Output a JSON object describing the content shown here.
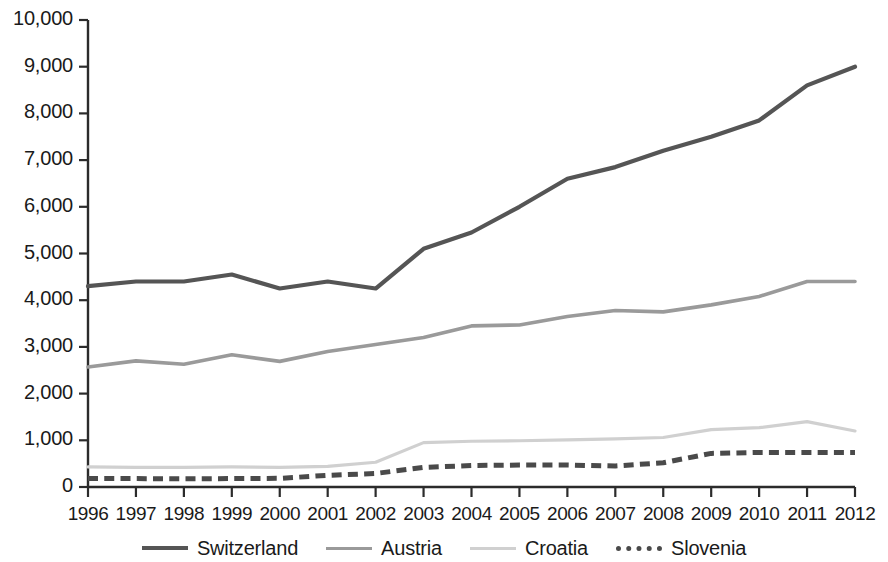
{
  "chart_data": {
    "type": "line",
    "title": "",
    "subtitle": "",
    "xlabel": "",
    "ylabel": "",
    "categories": [
      1996,
      1997,
      1998,
      1999,
      2000,
      2001,
      2002,
      2003,
      2004,
      2005,
      2006,
      2007,
      2008,
      2009,
      2010,
      2011,
      2012
    ],
    "x_tick_labels": [
      "1996",
      "1997",
      "1998",
      "1999",
      "2000",
      "2001",
      "2002",
      "2003",
      "2004",
      "2005",
      "2006",
      "2007",
      "2008",
      "2009",
      "2010",
      "2011",
      "2012"
    ],
    "y_tick_labels": [
      "0",
      "1,000",
      "2,000",
      "3,000",
      "4,000",
      "5,000",
      "6,000",
      "7,000",
      "8,000",
      "9,000",
      "10,000"
    ],
    "y_tick_values": [
      0,
      1000,
      2000,
      3000,
      4000,
      5000,
      6000,
      7000,
      8000,
      9000,
      10000
    ],
    "ylim": [
      0,
      10000
    ],
    "xlim": [
      1996,
      2012
    ],
    "grid": false,
    "legend_position": "bottom",
    "series": [
      {
        "name": "Switzerland",
        "color": "#555555",
        "style": "solid",
        "width": 4.2,
        "values": [
          4300,
          4400,
          4400,
          4550,
          4250,
          4400,
          4250,
          5100,
          5450,
          6000,
          6600,
          6850,
          7200,
          7500,
          7850,
          8600,
          9000
        ]
      },
      {
        "name": "Austria",
        "color": "#9a9a9a",
        "style": "solid",
        "width": 3.6,
        "values": [
          2570,
          2700,
          2630,
          2830,
          2690,
          2900,
          3050,
          3200,
          3450,
          3470,
          3650,
          3780,
          3750,
          3900,
          4080,
          4400,
          4400
        ]
      },
      {
        "name": "Croatia",
        "color": "#d0d0d0",
        "style": "solid",
        "width": 3.2,
        "values": [
          430,
          420,
          420,
          430,
          420,
          440,
          530,
          950,
          980,
          990,
          1010,
          1030,
          1060,
          1230,
          1270,
          1400,
          1200
        ]
      },
      {
        "name": "Slovenia",
        "color": "#4a4a4a",
        "style": "dashed",
        "width": 5.0,
        "values": [
          180,
          180,
          175,
          180,
          185,
          250,
          290,
          420,
          460,
          470,
          470,
          450,
          520,
          720,
          740,
          740,
          740
        ]
      }
    ]
  },
  "legend": {
    "items": [
      {
        "label": "Switzerland"
      },
      {
        "label": "Austria"
      },
      {
        "label": "Croatia"
      },
      {
        "label": "Slovenia"
      }
    ]
  },
  "axes": {
    "y_axis_name": "value-axis",
    "x_axis_name": "year-axis"
  }
}
